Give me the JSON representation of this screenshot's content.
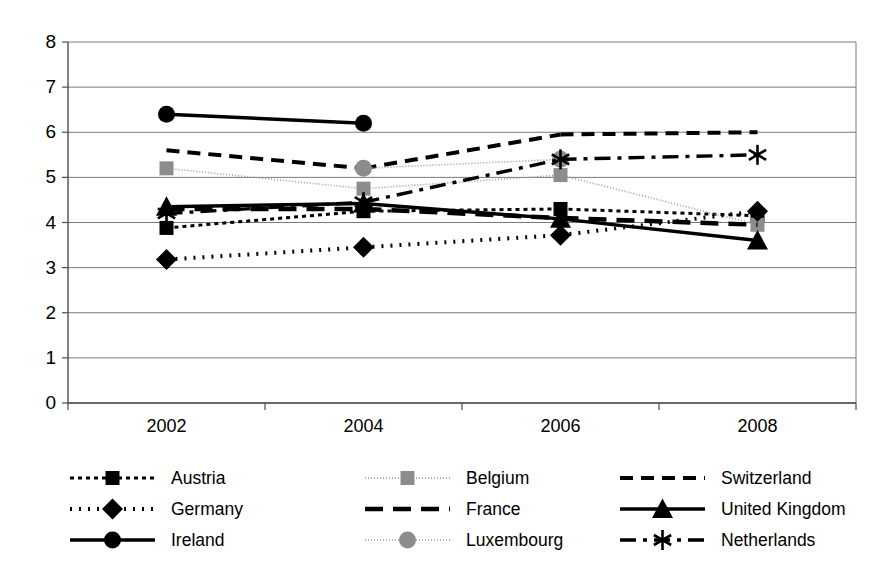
{
  "chart_data": {
    "type": "line",
    "title": "",
    "subtitle": "",
    "xlabel": "",
    "ylabel": "",
    "categories": [
      "2002",
      "2004",
      "2006",
      "2008"
    ],
    "x_tick_labels": [
      "2002",
      "2004",
      "2006",
      "2008"
    ],
    "y_tick_labels": [
      "0",
      "1",
      "2",
      "3",
      "4",
      "5",
      "6",
      "7",
      "8"
    ],
    "ylim": [
      0,
      8
    ],
    "y_tick_step": 1,
    "grid": "horizontal",
    "legend_position": "bottom",
    "legend_columns": 3,
    "series": [
      {
        "name": "Austria",
        "values": [
          3.88,
          4.25,
          4.3,
          4.15
        ],
        "marker": "square",
        "marker_color": "#000000",
        "line_color": "#000000",
        "line_style": "4,4",
        "line_width": 3
      },
      {
        "name": "Belgium",
        "values": [
          5.2,
          4.75,
          5.05,
          3.95
        ],
        "marker": "square",
        "marker_color": "#8c8c8c",
        "line_color": "#9a9a9a",
        "line_style": "1,2",
        "line_width": 1.6
      },
      {
        "name": "Switzerland",
        "values": [
          5.6,
          5.2,
          5.95,
          6.0
        ],
        "marker": "none",
        "marker_color": "#000000",
        "line_color": "#000000",
        "line_style": "13,8",
        "line_width": 4
      },
      {
        "name": "Germany",
        "values": [
          3.18,
          3.45,
          3.72,
          4.25
        ],
        "marker": "diamond",
        "marker_color": "#000000",
        "line_color": "#000000",
        "line_style": "2,7",
        "line_width": 4
      },
      {
        "name": "France",
        "values": [
          4.3,
          4.3,
          4.1,
          3.95
        ],
        "marker": "none",
        "marker_color": "#000000",
        "line_color": "#000000",
        "line_style": "18,10",
        "line_width": 4.5
      },
      {
        "name": "United Kingdom",
        "values": [
          4.35,
          4.42,
          4.08,
          3.6
        ],
        "marker": "triangle",
        "marker_color": "#000000",
        "line_color": "#000000",
        "line_style": "none",
        "line_width": 3.4
      },
      {
        "name": "Ireland",
        "values": [
          6.4,
          6.2,
          null,
          null
        ],
        "marker": "circle",
        "marker_color": "#000000",
        "line_color": "#000000",
        "line_style": "none",
        "line_width": 3.4
      },
      {
        "name": "Luxembourg",
        "values": [
          null,
          5.2,
          5.4,
          null
        ],
        "marker": "circle",
        "marker_color": "#8c8c8c",
        "line_color": "#9a9a9a",
        "line_style": "1,2",
        "line_width": 1.6
      },
      {
        "name": "Netherlands",
        "values": [
          4.2,
          4.45,
          5.4,
          5.5
        ],
        "marker": "asterisk",
        "marker_color": "#000000",
        "line_color": "#000000",
        "line_style": "16,7,4,7",
        "line_width": 3.4
      }
    ]
  },
  "legend": {
    "entries": [
      {
        "label": "Austria",
        "key": "Austria"
      },
      {
        "label": "Belgium",
        "key": "Belgium"
      },
      {
        "label": "Switzerland",
        "key": "Switzerland"
      },
      {
        "label": "Germany",
        "key": "Germany"
      },
      {
        "label": "France",
        "key": "France"
      },
      {
        "label": "United Kingdom",
        "key": "United Kingdom"
      },
      {
        "label": "Ireland",
        "key": "Ireland"
      },
      {
        "label": "Luxembourg",
        "key": "Luxembourg"
      },
      {
        "label": "Netherlands",
        "key": "Netherlands"
      }
    ]
  },
  "colors": {
    "axis": "#4d4d4d",
    "grid": "#7a7a7a",
    "series_black": "#000000",
    "series_gray": "#8c8c8c",
    "background": "#ffffff"
  }
}
